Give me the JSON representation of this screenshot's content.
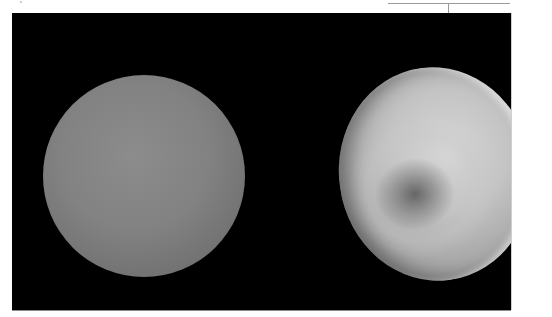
{
  "figure": {
    "panel_background": "#000000",
    "left_image": {
      "label": "",
      "description": "uniform gray planetary disk"
    },
    "right_image": {
      "label": "",
      "description": "enhanced planetary disk with cloud band structure and dark central region"
    }
  }
}
